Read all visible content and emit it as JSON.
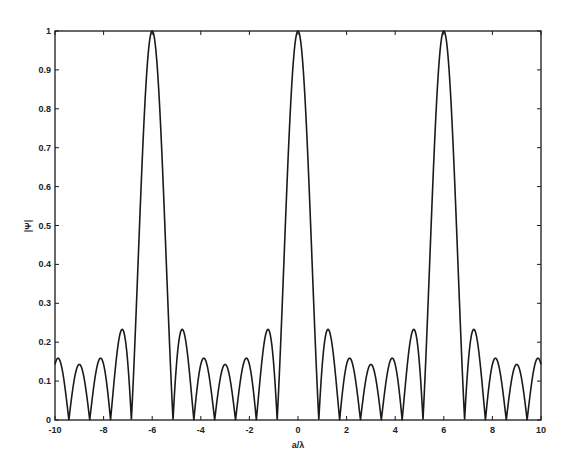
{
  "chart_data": {
    "type": "line",
    "title": "",
    "xlabel": "a/λ",
    "ylabel": "|Ψ|",
    "xlim": [
      -10,
      10
    ],
    "ylim": [
      0,
      1
    ],
    "grid": false,
    "legend": null,
    "xticks": [
      -10,
      -8,
      -6,
      -4,
      -2,
      0,
      2,
      4,
      6,
      8,
      10
    ],
    "xtick_labels": [
      "-10",
      "-8",
      "-6",
      "-4",
      "-2",
      "0",
      "2",
      "4",
      "6",
      "8",
      "10"
    ],
    "yticks": [
      0,
      0.1,
      0.2,
      0.3,
      0.4,
      0.5,
      0.6,
      0.7,
      0.8,
      0.9,
      1
    ],
    "ytick_labels": [
      "0",
      "0.1",
      "0.2",
      "0.3",
      "0.4",
      "0.5",
      "0.6",
      "0.7",
      "0.8",
      "0.9",
      "1"
    ],
    "main_lobe_peaks": [
      {
        "x": -6,
        "y": 1.0
      },
      {
        "x": 0,
        "y": 1.0
      },
      {
        "x": 6,
        "y": 1.0
      }
    ],
    "side_lobe_levels": [
      0.23,
      0.16,
      0.14
    ],
    "period": 6,
    "elements": 7,
    "series": [
      {
        "name": "|Ψ|",
        "color": "#1a1a1a"
      }
    ]
  }
}
